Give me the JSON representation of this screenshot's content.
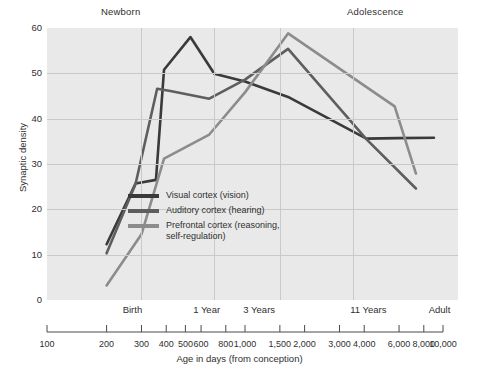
{
  "chart_data": {
    "type": "line",
    "title": "",
    "xlabel": "Age in days (from conception)",
    "ylabel": "Synaptic density",
    "xscale": "log",
    "xlim": [
      100,
      10000
    ],
    "ylim": [
      0,
      60
    ],
    "grid": true,
    "legend_position": "inside-center-left",
    "y_ticks": [
      0,
      10,
      20,
      30,
      40,
      50,
      60
    ],
    "x_ticks": [
      100,
      200,
      300,
      400,
      500,
      600,
      800,
      1000,
      1500,
      2000,
      3000,
      4000,
      6000,
      8000,
      10000
    ],
    "x_tick_labels": [
      "100",
      "200",
      "300",
      "400",
      "500",
      "600",
      "800",
      "1,000",
      "1,500",
      "2,000",
      "3,000",
      "4,000",
      "6,000",
      "8,000",
      "10,000"
    ],
    "stage_labels_bottom": [
      {
        "text": "Birth",
        "x": 270
      },
      {
        "text": "1 Year",
        "x": 640
      },
      {
        "text": "3 Years",
        "x": 1180
      },
      {
        "text": "11 Years",
        "x": 4200
      },
      {
        "text": "Adult",
        "x": 9600
      }
    ],
    "stage_labels_top": [
      {
        "text": "Newborn",
        "x": 290
      },
      {
        "text": "Adolescence",
        "x": 5200
      }
    ],
    "gridlines_x": [
      300,
      700,
      1500,
      3500
    ],
    "series": [
      {
        "name": "Visual cortex (vision)",
        "color": "#3a3a3a",
        "points": [
          [
            200,
            12.3
          ],
          [
            280,
            25.7
          ],
          [
            355,
            26.5
          ],
          [
            390,
            50.8
          ],
          [
            530,
            58.0
          ],
          [
            700,
            49.9
          ],
          [
            1000,
            48.2
          ],
          [
            1650,
            44.8
          ],
          [
            4100,
            35.6
          ],
          [
            5900,
            35.7
          ],
          [
            9000,
            35.8
          ]
        ]
      },
      {
        "name": "Auditory cortex (hearing)",
        "color": "#5e5e5e",
        "points": [
          [
            200,
            10.3
          ],
          [
            280,
            25.6
          ],
          [
            360,
            46.6
          ],
          [
            420,
            46.1
          ],
          [
            660,
            44.4
          ],
          [
            1000,
            48.6
          ],
          [
            1650,
            55.4
          ],
          [
            4100,
            35.5
          ],
          [
            7300,
            24.6
          ]
        ]
      },
      {
        "name": "Prefrontal cortex (reasoning, self-regulation)",
        "color": "#8c8c8c",
        "points": [
          [
            200,
            3.2
          ],
          [
            300,
            14.5
          ],
          [
            390,
            31.2
          ],
          [
            660,
            36.5
          ],
          [
            1000,
            45.8
          ],
          [
            1650,
            58.8
          ],
          [
            5700,
            42.7
          ],
          [
            7300,
            27.9
          ]
        ]
      }
    ]
  },
  "legend": {
    "items": [
      {
        "label": "Visual cortex (vision)",
        "color": "#3a3a3a"
      },
      {
        "label": "Auditory cortex (hearing)",
        "color": "#5e5e5e"
      },
      {
        "label": "Prefrontal cortex (reasoning,\nself-regulation)",
        "color": "#8c8c8c"
      }
    ]
  },
  "axes": {
    "y_title": "Synaptic density",
    "x_title": "Age in days (from conception)"
  },
  "colors": {
    "plot_background": "#e9e9e9",
    "gridline": "#c9c9c9",
    "text": "#2f2f2f",
    "axis": "#4a4a4a"
  }
}
